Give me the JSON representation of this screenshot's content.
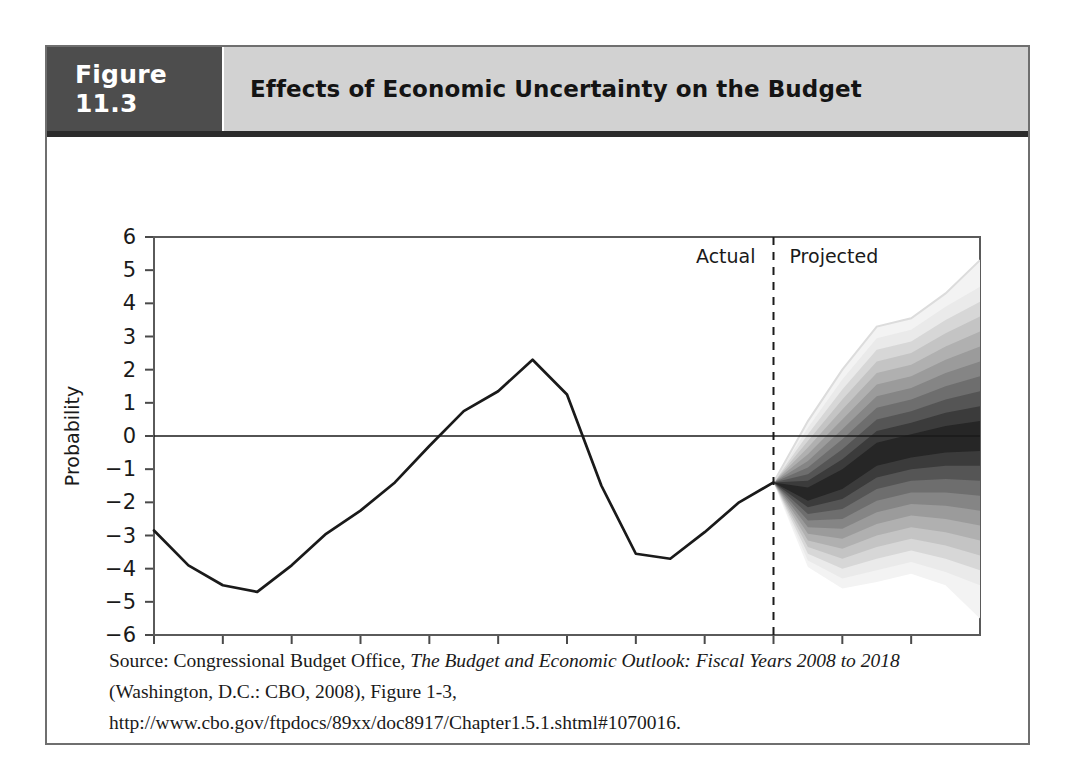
{
  "figure": {
    "number_label": "Figure 11.3",
    "title": "Effects of Economic Uncertainty on the Budget",
    "source_prefix": "Source: Congressional Budget Office, ",
    "source_italic": "The Budget and Economic Outlook: Fiscal Years 2008 to 2018",
    "source_suffix": " (Washington, D.C.: CBO, 2008), Figure 1-3, http://www.cbo.gov/ftpdocs/89xx/doc8917/Chapter1.5.1.shtml#1070016."
  },
  "annotations": {
    "actual_label": "Actual",
    "projected_label": "Projected"
  },
  "colors": {
    "figure_number_bg": "#4d4d4d",
    "title_bg": "#d2d2d2",
    "frame": "#6f6f6f",
    "line": "#1a1a1a",
    "fan_darkest": "#1c1c1c",
    "fan_lightest": "#e8e8e8"
  },
  "chart_data": {
    "type": "area",
    "title": "Effects of Economic Uncertainty on the Budget",
    "xlabel": "",
    "ylabel": "Probability",
    "xlim": [
      1989,
      2013
    ],
    "ylim": [
      -6,
      6
    ],
    "grid": false,
    "legend_position": "none",
    "y_ticks": [
      6,
      5,
      4,
      3,
      2,
      1,
      0,
      -1,
      -2,
      -3,
      -4,
      -5,
      -6
    ],
    "y_tick_labels": [
      "6",
      "5",
      "4",
      "3",
      "2",
      "1",
      "0",
      "−1",
      "−2",
      "−3",
      "−4",
      "−5",
      "−6"
    ],
    "x_ticks": [
      1989,
      1991,
      1993,
      1995,
      1997,
      1999,
      2001,
      2003,
      2005,
      2007,
      2009,
      2011
    ],
    "x_tick_labels": [
      "1989",
      "1991",
      "1993",
      "1995",
      "1997",
      "1999",
      "2001",
      "2003",
      "2005",
      "2007",
      "2009",
      "2011"
    ],
    "zero_line": 0,
    "divider_year": 2007,
    "series": [
      {
        "name": "Actual (historical surplus/deficit, percent of GDP)",
        "x": [
          1989,
          1990,
          1991,
          1992,
          1993,
          1994,
          1995,
          1996,
          1997,
          1998,
          1999,
          2000,
          2001,
          2002,
          2003,
          2004,
          2005,
          2006,
          2007
        ],
        "values": [
          -2.85,
          -3.9,
          -4.5,
          -4.7,
          -3.9,
          -2.95,
          -2.25,
          -1.4,
          -0.3,
          0.75,
          1.35,
          2.3,
          1.25,
          -1.5,
          -3.55,
          -3.7,
          -2.9,
          -2.0,
          -1.4
        ]
      }
    ],
    "fan": {
      "description": "Probability fan of projected outcomes, 2007 to 2013, 10 nested confidence bands shaded darkest at the center",
      "x": [
        2007,
        2008,
        2009,
        2010,
        2011,
        2012,
        2013
      ],
      "center": [
        -1.4,
        -1.75,
        -1.3,
        -0.55,
        -0.3,
        -0.1,
        0.0
      ],
      "bands": [
        {
          "level": 10,
          "shade": "#262626",
          "lower": [
            -1.4,
            -1.95,
            -1.6,
            -0.9,
            -0.65,
            -0.5,
            -0.45
          ],
          "upper": [
            -1.4,
            -1.55,
            -1.0,
            -0.2,
            0.05,
            0.3,
            0.45
          ]
        },
        {
          "level": 20,
          "shade": "#3b3b3b",
          "lower": [
            -1.4,
            -2.15,
            -1.9,
            -1.25,
            -1.0,
            -0.9,
            -0.9
          ],
          "upper": [
            -1.4,
            -1.35,
            -0.7,
            0.15,
            0.4,
            0.7,
            0.9
          ]
        },
        {
          "level": 30,
          "shade": "#555555",
          "lower": [
            -1.4,
            -2.35,
            -2.2,
            -1.6,
            -1.35,
            -1.3,
            -1.35
          ],
          "upper": [
            -1.4,
            -1.15,
            -0.4,
            0.5,
            0.75,
            1.1,
            1.35
          ]
        },
        {
          "level": 40,
          "shade": "#6e6e6e",
          "lower": [
            -1.4,
            -2.55,
            -2.5,
            -1.95,
            -1.7,
            -1.7,
            -1.8
          ],
          "upper": [
            -1.4,
            -0.95,
            -0.1,
            0.85,
            1.1,
            1.5,
            1.8
          ]
        },
        {
          "level": 50,
          "shade": "#858585",
          "lower": [
            -1.4,
            -2.75,
            -2.8,
            -2.3,
            -2.05,
            -2.1,
            -2.25
          ],
          "upper": [
            -1.4,
            -0.75,
            0.2,
            1.2,
            1.45,
            1.9,
            2.25
          ]
        },
        {
          "level": 60,
          "shade": "#9b9b9b",
          "lower": [
            -1.4,
            -2.95,
            -3.1,
            -2.65,
            -2.4,
            -2.5,
            -2.7
          ],
          "upper": [
            -1.4,
            -0.55,
            0.5,
            1.55,
            1.8,
            2.3,
            2.7
          ]
        },
        {
          "level": 70,
          "shade": "#b0b0b0",
          "lower": [
            -1.4,
            -3.15,
            -3.4,
            -3.0,
            -2.75,
            -2.9,
            -3.15
          ],
          "upper": [
            -1.4,
            -0.35,
            0.8,
            1.9,
            2.15,
            2.7,
            3.15
          ]
        },
        {
          "level": 80,
          "shade": "#c4c4c4",
          "lower": [
            -1.4,
            -3.35,
            -3.7,
            -3.35,
            -3.1,
            -3.3,
            -3.6
          ],
          "upper": [
            -1.4,
            -0.15,
            1.1,
            2.25,
            2.5,
            3.1,
            3.6
          ]
        },
        {
          "level": 90,
          "shade": "#d7d7d7",
          "lower": [
            -1.4,
            -3.55,
            -4.0,
            -3.7,
            -3.45,
            -3.7,
            -4.05
          ],
          "upper": [
            -1.4,
            0.05,
            1.4,
            2.6,
            2.85,
            3.5,
            4.05
          ]
        },
        {
          "level": 95,
          "shade": "#eaeaea",
          "lower": [
            -1.4,
            -3.75,
            -4.3,
            -4.05,
            -3.8,
            -4.1,
            -4.5
          ],
          "upper": [
            -1.4,
            0.25,
            1.7,
            2.95,
            3.2,
            3.9,
            4.5
          ]
        }
      ],
      "outer_upper": [
        -1.4,
        0.45,
        2.0,
        3.3,
        3.55,
        4.3,
        5.3
      ],
      "outer_lower": [
        -1.4,
        -3.95,
        -4.6,
        -4.4,
        -4.15,
        -4.5,
        -5.5
      ]
    }
  }
}
